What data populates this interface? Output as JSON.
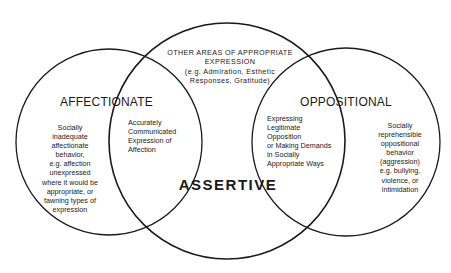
{
  "diagram": {
    "type": "venn",
    "circles": [
      {
        "id": "affectionate",
        "label": "AFFECTIONATE"
      },
      {
        "id": "assertive",
        "label": "ASSERTIVE"
      },
      {
        "id": "oppositional",
        "label": "OPPOSITIONAL"
      }
    ],
    "stroke_color": "#1a1a1a"
  },
  "regions": {
    "top": {
      "line1": "OTHER AREAS OF APPROPRIATE",
      "line2": "EXPRESSION",
      "line3": "(e.g. Admiration, Esthetic",
      "line4": "Responses, Gratitude)"
    },
    "affectionate_only": {
      "lines": [
        "Socially",
        "inadequate",
        "affectionate",
        "behavior,",
        "e.g. affection",
        "unexpressed",
        "where it would be",
        "appropriate, or",
        "fawning types of",
        "expression"
      ]
    },
    "affectionate_assertive": {
      "lines": [
        "Accurately",
        "Communicated",
        "Expression of",
        "Affection"
      ]
    },
    "oppositional_assertive": {
      "lines": [
        "Expressing",
        "Legitimate",
        "Opposition",
        "or Making Demands",
        "in Socially",
        "Appropriate Ways"
      ]
    },
    "oppositional_only": {
      "lines": [
        "Socially",
        "reprehensible",
        "oppositional",
        "behavior",
        "(aggression)",
        "e.g. bullying,",
        "violence, or",
        "intimidation"
      ]
    }
  }
}
